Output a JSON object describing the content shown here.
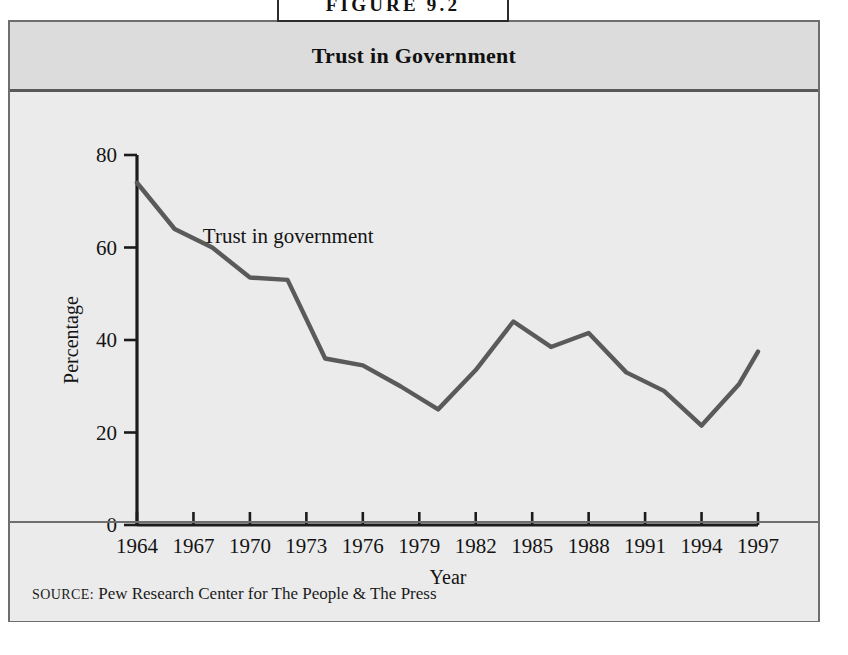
{
  "figure": {
    "tab_label": "FIGURE 9.2",
    "title": "Trust in Government",
    "source_label": "SOURCE:",
    "source_text": "Pew Research Center for The People & The Press"
  },
  "colors": {
    "page_background": "#ffffff",
    "panel_background": "#e9e9e9",
    "title_band_background": "#dcdcdc",
    "plot_background": "#ebebeb",
    "frame_border": "#6e6e6e",
    "tab_border": "#2c2c2c",
    "axis_line": "#1b1b1b",
    "series_line": "#5a5a5a",
    "text": "#141414"
  },
  "chart_data": {
    "type": "line",
    "title": "Trust in Government",
    "xlabel": "Year",
    "ylabel": "Percentage",
    "xlim": [
      1964,
      1997
    ],
    "ylim": [
      0,
      80
    ],
    "grid": false,
    "legend": false,
    "annotations": [
      {
        "text": "Trust in government",
        "x": 1967.5,
        "y": 61
      }
    ],
    "ytick_labels": [
      "0",
      "20",
      "40",
      "60",
      "80"
    ],
    "yticks": [
      0,
      20,
      40,
      60,
      80
    ],
    "xtick_labels": [
      "1964",
      "1967",
      "1970",
      "1973",
      "1976",
      "1979",
      "1982",
      "1985",
      "1988",
      "1991",
      "1994",
      "1997"
    ],
    "xticks": [
      1964,
      1967,
      1970,
      1973,
      1976,
      1979,
      1982,
      1985,
      1988,
      1991,
      1994,
      1997
    ],
    "series": [
      {
        "name": "Trust in government",
        "x": [
          1964,
          1966,
          1968,
          1970,
          1972,
          1974,
          1976,
          1978,
          1980,
          1982,
          1984,
          1986,
          1988,
          1990,
          1992,
          1994,
          1996,
          1997
        ],
        "values": [
          74,
          64,
          60,
          53.5,
          53,
          36,
          34.5,
          30,
          25,
          33.5,
          44,
          38.5,
          41.5,
          33,
          29,
          21.5,
          30.5,
          37.5
        ]
      }
    ]
  }
}
